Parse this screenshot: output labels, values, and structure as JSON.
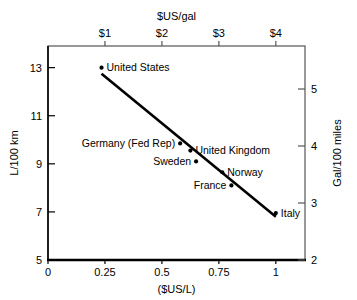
{
  "chart_data": {
    "type": "scatter",
    "title": "",
    "xlabel": "($US/L)",
    "ylabel": "L/100 km",
    "xlabel_top": "$US/gal",
    "ylabel_right": "Gal/100 miles",
    "xlim": [
      0,
      1.128
    ],
    "ylim": [
      5,
      13.9
    ],
    "grid": false,
    "legend": "none",
    "x_ticks": [
      "0",
      "0.25",
      "0.5",
      "0.75",
      "1"
    ],
    "x_tick_values": [
      0,
      0.25,
      0.5,
      0.75,
      1
    ],
    "y_ticks": [
      "5",
      "7",
      "9",
      "11",
      "13"
    ],
    "y_tick_values": [
      5,
      7,
      9,
      11,
      13
    ],
    "x_ticks_top": [
      "$1",
      "$2",
      "$3",
      "$4"
    ],
    "x_tick_top_values": [
      0.25,
      0.5,
      0.75,
      1.0
    ],
    "y_ticks_right": [
      "2",
      "3",
      "4",
      "5"
    ],
    "y_tick_right_values": [
      2,
      3,
      4,
      5
    ],
    "points": [
      {
        "label": "United States",
        "x": 0.235,
        "y": 13.0,
        "label_side": "right"
      },
      {
        "label": "Germany (Fed Rep)",
        "x": 0.58,
        "y": 9.85,
        "label_side": "left"
      },
      {
        "label": "United Kingdom",
        "x": 0.625,
        "y": 9.55,
        "label_side": "right"
      },
      {
        "label": "Sweden",
        "x": 0.65,
        "y": 9.1,
        "label_side": "left"
      },
      {
        "label": "Norway",
        "x": 0.765,
        "y": 8.65,
        "label_side": "right"
      },
      {
        "label": "France",
        "x": 0.805,
        "y": 8.1,
        "label_side": "left"
      },
      {
        "label": "Italy",
        "x": 1.0,
        "y": 6.95,
        "label_side": "right"
      }
    ],
    "trend_line": {
      "x0": 0.235,
      "y0": 12.75,
      "x1": 1.0,
      "y1": 6.8
    }
  },
  "colors": {
    "ink": "#000000",
    "background": "#ffffff",
    "frame": "#555555"
  }
}
